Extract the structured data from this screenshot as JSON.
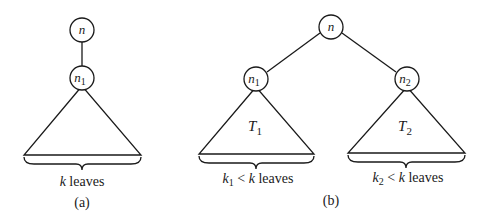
{
  "diagram": {
    "panels": [
      {
        "id": "a",
        "caption": "(a)",
        "nodes": [
          {
            "id": "n",
            "label": "n",
            "subscript": ""
          },
          {
            "id": "n1",
            "label": "n",
            "subscript": "1"
          }
        ],
        "edges": [
          [
            "n",
            "n1"
          ]
        ],
        "subtree": {
          "root": "n1",
          "label": ""
        },
        "leaves_label": {
          "var": "k",
          "sub": "",
          "rest": " leaves"
        }
      },
      {
        "id": "b",
        "caption": "(b)",
        "nodes": [
          {
            "id": "n",
            "label": "n",
            "subscript": ""
          },
          {
            "id": "n1",
            "label": "n",
            "subscript": "1"
          },
          {
            "id": "n2",
            "label": "n",
            "subscript": "2"
          }
        ],
        "edges": [
          [
            "n",
            "n1"
          ],
          [
            "n",
            "n2"
          ]
        ],
        "subtrees": [
          {
            "root": "n1",
            "label": "T",
            "subscript": "1",
            "leaves_label": {
              "var": "k",
              "sub": "1",
              "op": " < ",
              "var2": "k",
              "rest": " leaves"
            }
          },
          {
            "root": "n2",
            "label": "T",
            "subscript": "2",
            "leaves_label": {
              "var": "k",
              "sub": "2",
              "op": " < ",
              "var2": "k",
              "rest": " leaves"
            }
          }
        ]
      }
    ]
  },
  "colors": {
    "stroke": "#1a1a1a",
    "background": "#ffffff"
  }
}
